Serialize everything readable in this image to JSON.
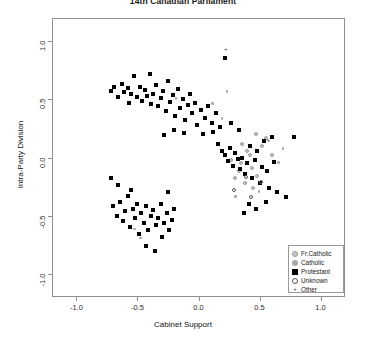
{
  "chart_data": {
    "type": "scatter",
    "title": "14th Canadian Parliament",
    "xlabel": "Cabinet Support",
    "ylabel": "Intra-Party Division",
    "xlim": [
      -1.2,
      1.2
    ],
    "ylim": [
      -1.2,
      1.2
    ],
    "xticks": [
      "-1.0",
      "-0.5",
      "0.0",
      "0.5",
      "1.0"
    ],
    "xtickvals": [
      -1.0,
      -0.5,
      0.0,
      0.5,
      1.0
    ],
    "yticks": [
      "1.0",
      "0.5",
      "0.0",
      "-0.5",
      "-1.0"
    ],
    "ytickvals": [
      1.0,
      0.5,
      0.0,
      -0.5,
      -1.0
    ],
    "grid": false,
    "legend_position": "bottom-right",
    "series": [
      {
        "name": "Fr.Catholic",
        "marker": "gray-filled-circle",
        "color": "#c9c9c9",
        "points": [
          [
            0.47,
            0.2
          ],
          [
            0.4,
            0.06
          ],
          [
            0.42,
            0.02
          ],
          [
            0.35,
            -0.05
          ],
          [
            0.44,
            -0.09
          ],
          [
            0.33,
            -0.12
          ],
          [
            0.48,
            -0.16
          ],
          [
            0.3,
            -0.18
          ],
          [
            0.52,
            0.1
          ],
          [
            0.38,
            -0.22
          ],
          [
            0.55,
            0.17
          ],
          [
            0.27,
            -0.02
          ],
          [
            0.6,
            0.02
          ],
          [
            0.45,
            -0.26
          ],
          [
            0.36,
            0.12
          ]
        ]
      },
      {
        "name": "Catholic",
        "marker": "small-gray-dot",
        "color": "#a8a8a8",
        "points": [
          [
            0.12,
            0.46
          ],
          [
            0.58,
            0.14
          ],
          [
            0.66,
            -0.05
          ],
          [
            0.24,
            0.56
          ],
          [
            -0.18,
            0.5
          ],
          [
            0.5,
            -0.3
          ],
          [
            0.31,
            -0.34
          ],
          [
            0.7,
            0.07
          ],
          [
            -0.52,
            -0.62
          ],
          [
            -0.47,
            -0.7
          ],
          [
            0.2,
            0.33
          ]
        ]
      },
      {
        "name": "Protestant",
        "marker": "black-filled-square",
        "color": "#000000",
        "points": [
          [
            -0.72,
            0.57
          ],
          [
            -0.69,
            0.61
          ],
          [
            -0.66,
            0.52
          ],
          [
            -0.63,
            0.63
          ],
          [
            -0.61,
            0.56
          ],
          [
            -0.58,
            0.6
          ],
          [
            -0.57,
            0.47
          ],
          [
            -0.55,
            0.55
          ],
          [
            -0.53,
            0.7
          ],
          [
            -0.5,
            0.52
          ],
          [
            -0.48,
            0.61
          ],
          [
            -0.46,
            0.49
          ],
          [
            -0.44,
            0.58
          ],
          [
            -0.42,
            0.53
          ],
          [
            -0.4,
            0.72
          ],
          [
            -0.39,
            0.46
          ],
          [
            -0.37,
            0.55
          ],
          [
            -0.35,
            0.62
          ],
          [
            -0.33,
            0.44
          ],
          [
            -0.31,
            0.51
          ],
          [
            -0.29,
            0.57
          ],
          [
            -0.27,
            0.4
          ],
          [
            -0.25,
            0.66
          ],
          [
            -0.23,
            0.48
          ],
          [
            -0.21,
            0.54
          ],
          [
            -0.19,
            0.36
          ],
          [
            -0.17,
            0.59
          ],
          [
            -0.15,
            0.43
          ],
          [
            -0.13,
            0.5
          ],
          [
            -0.11,
            0.32
          ],
          [
            -0.09,
            0.45
          ],
          [
            -0.07,
            0.55
          ],
          [
            -0.05,
            0.38
          ],
          [
            -0.03,
            0.47
          ],
          [
            -0.01,
            0.28
          ],
          [
            0.02,
            0.41
          ],
          [
            0.05,
            0.34
          ],
          [
            0.08,
            0.44
          ],
          [
            0.11,
            0.3
          ],
          [
            0.14,
            0.38
          ],
          [
            -0.28,
            0.19
          ],
          [
            -0.2,
            0.24
          ],
          [
            -0.12,
            0.21
          ],
          [
            -0.72,
            -0.18
          ],
          [
            -0.66,
            -0.24
          ],
          [
            -0.7,
            -0.42
          ],
          [
            -0.67,
            -0.5
          ],
          [
            -0.64,
            -0.38
          ],
          [
            -0.62,
            -0.55
          ],
          [
            -0.6,
            -0.46
          ],
          [
            -0.58,
            -0.33
          ],
          [
            -0.56,
            -0.6
          ],
          [
            -0.54,
            -0.44
          ],
          [
            -0.52,
            -0.52
          ],
          [
            -0.5,
            -0.4
          ],
          [
            -0.49,
            -0.66
          ],
          [
            -0.47,
            -0.48
          ],
          [
            -0.45,
            -0.56
          ],
          [
            -0.43,
            -0.42
          ],
          [
            -0.41,
            -0.62
          ],
          [
            -0.39,
            -0.5
          ],
          [
            -0.37,
            -0.45
          ],
          [
            -0.35,
            -0.58
          ],
          [
            -0.33,
            -0.52
          ],
          [
            -0.31,
            -0.4
          ],
          [
            -0.3,
            -0.68
          ],
          [
            -0.28,
            -0.56
          ],
          [
            -0.26,
            -0.48
          ],
          [
            -0.24,
            -0.62
          ],
          [
            -0.22,
            -0.54
          ],
          [
            -0.2,
            -0.44
          ],
          [
            -0.43,
            -0.76
          ],
          [
            -0.36,
            -0.8
          ],
          [
            -0.55,
            -0.28
          ],
          [
            -0.25,
            -0.3
          ],
          [
            0.22,
            0.86
          ],
          [
            0.04,
            0.2
          ],
          [
            0.16,
            0.12
          ],
          [
            0.19,
            0.06
          ],
          [
            0.22,
            0.02
          ],
          [
            0.24,
            -0.03
          ],
          [
            0.26,
            0.08
          ],
          [
            0.28,
            -0.07
          ],
          [
            0.3,
            0.04
          ],
          [
            0.32,
            -0.01
          ],
          [
            0.34,
            -0.1
          ],
          [
            0.36,
            0.0
          ],
          [
            0.38,
            -0.14
          ],
          [
            0.4,
            -0.05
          ],
          [
            0.42,
            0.1
          ],
          [
            0.44,
            -0.18
          ],
          [
            0.46,
            -0.02
          ],
          [
            0.48,
            0.06
          ],
          [
            0.5,
            -0.22
          ],
          [
            0.52,
            -0.08
          ],
          [
            0.54,
            0.14
          ],
          [
            0.56,
            -0.12
          ],
          [
            0.58,
            -0.26
          ],
          [
            0.6,
            0.18
          ],
          [
            0.62,
            -0.04
          ],
          [
            0.64,
            -0.3
          ],
          [
            0.12,
            0.22
          ],
          [
            0.18,
            0.26
          ],
          [
            0.27,
            0.3
          ],
          [
            0.33,
            0.24
          ],
          [
            0.78,
            0.18
          ],
          [
            0.72,
            -0.34
          ],
          [
            0.41,
            -0.4
          ],
          [
            0.47,
            -0.44
          ],
          [
            0.55,
            -0.38
          ],
          [
            0.37,
            -0.48
          ]
        ]
      },
      {
        "name": "Unknown",
        "marker": "open-circle",
        "color": "#555555",
        "points": [
          [
            0.43,
            -0.34
          ],
          [
            0.39,
            -0.17
          ],
          [
            0.51,
            -0.21
          ],
          [
            0.29,
            -0.28
          ]
        ]
      },
      {
        "name": "Other",
        "marker": "plus",
        "color": "#444444",
        "points": [
          [
            0.22,
            0.93
          ]
        ]
      }
    ]
  },
  "legend": {
    "items": [
      {
        "label": "Fr.Catholic",
        "marker": "gray-filled-circle"
      },
      {
        "label": "Catholic",
        "marker": "small-gray-dot"
      },
      {
        "label": "Protestant",
        "marker": "black-filled-square"
      },
      {
        "label": "Unknown",
        "marker": "open-circle"
      },
      {
        "label": "Other",
        "marker": "plus"
      }
    ]
  }
}
